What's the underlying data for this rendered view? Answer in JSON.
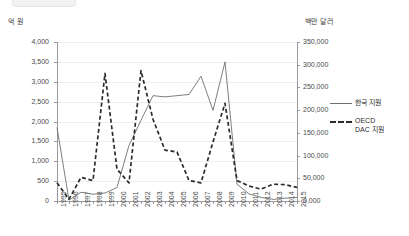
{
  "axes": {
    "left_unit": "억 원",
    "right_unit": "백만 달러",
    "left_ticks": [
      "4,000",
      "3,500",
      "3,000",
      "2,500",
      "2,000",
      "1,500",
      "1,000",
      "500",
      "0"
    ],
    "right_ticks": [
      "350,000",
      "300,000",
      "250,000",
      "200,000",
      "150,000",
      "100,000",
      "50,000",
      "0,000"
    ]
  },
  "legend": {
    "items": [
      {
        "label": "한국 지원",
        "style": "solid",
        "color": "#6f6f6f"
      },
      {
        "label": "OECD\nDAC 지원",
        "style": "dashed",
        "color": "#2b2b2b"
      }
    ]
  },
  "chart_data": {
    "type": "line",
    "title": "",
    "xlabel": "",
    "ylabel": "억 원",
    "y2label": "백만 달러",
    "grid": true,
    "legend_position": "right",
    "categories": [
      "1995",
      "1996",
      "1997",
      "1998",
      "1999",
      "2000",
      "2001",
      "2002",
      "2003",
      "2004",
      "2005",
      "2006",
      "2007",
      "2008",
      "2009",
      "2010",
      "2011",
      "2012",
      "2013",
      "2014",
      "2015"
    ],
    "ylim": [
      0,
      4000
    ],
    "y2lim": [
      0,
      350000
    ],
    "series": [
      {
        "name": "한국 지원",
        "axis": "left",
        "unit": "억 원",
        "style": "solid",
        "color": "#6f6f6f",
        "values": [
          1850,
          20,
          220,
          170,
          200,
          340,
          1400,
          2030,
          2650,
          2620,
          2650,
          2680,
          3140,
          2280,
          3500,
          420,
          180,
          90,
          40,
          70,
          90
        ]
      },
      {
        "name": "OECD DAC 지원",
        "axis": "right",
        "unit": "백만 달러",
        "style": "dashed",
        "color": "#2b2b2b",
        "values": [
          40000,
          4000,
          52000,
          45000,
          281000,
          70000,
          40000,
          287000,
          180000,
          112000,
          108000,
          45000,
          40000,
          130000,
          215000,
          45000,
          33000,
          26000,
          37000,
          36000,
          30000
        ]
      }
    ]
  }
}
